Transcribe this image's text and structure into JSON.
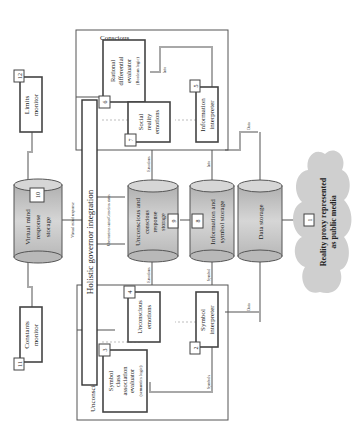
{
  "regions": {
    "conscious": "Conscious",
    "unconscious": "Unconscious"
  },
  "bar": {
    "holistic": "Holistic governor integration"
  },
  "nodes": {
    "n1": {
      "num": "1",
      "label": "Reality proxy represented",
      "label2": "as public media"
    },
    "n2": {
      "num": "2",
      "label": "Symbol",
      "label2": "interpreter"
    },
    "n3": {
      "num": "3",
      "label": "Symbol",
      "label2": "class",
      "label3": "association",
      "label4": "evaluator",
      "label5": "(semantics logic)"
    },
    "n4": {
      "num": "4",
      "label": "Unconscious",
      "label2": "emotions"
    },
    "n5": {
      "num": "5",
      "label": "Information",
      "label2": "interpreter"
    },
    "n6": {
      "num": "6",
      "label": "Rational",
      "label2": "differential",
      "label3": "evaluator",
      "label4": "(Boolean logic)"
    },
    "n7": {
      "num": "7",
      "label": "Social",
      "label2": "reality",
      "label3": "emotions"
    },
    "n8": {
      "num": "8",
      "label": "Information and",
      "label2": "symbol storage"
    },
    "n9": {
      "num": "9",
      "label": "Unconscious and",
      "label2": "conscious",
      "label3": "response",
      "label4": "storage"
    },
    "n10": {
      "num": "10",
      "label": "Virtual mind",
      "label2": "response",
      "label3": "storage"
    },
    "n11": {
      "num": "11",
      "label": "Constants",
      "label2": "monitor"
    },
    "n12": {
      "num": "12",
      "label": "Limits",
      "label2": "monitor"
    },
    "data_storage": {
      "label": "Data storage"
    }
  },
  "edges": {
    "data1": "Data",
    "data2": "Data",
    "data3": "Data",
    "info1": "Info",
    "info2": "Info",
    "symbols1": "Symbols",
    "symbols2": "Symbol",
    "emotions1": "Emotions",
    "emotions2": "Emotions",
    "status": "Unconscious status/Conscious status",
    "virtual": "Virtual mind response"
  }
}
